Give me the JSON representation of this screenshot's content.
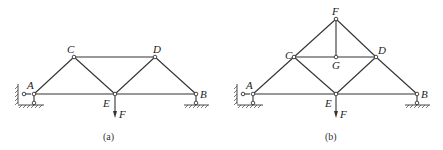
{
  "figures": [
    {
      "id": "a",
      "caption": "(a)",
      "nodes": {
        "A": {
          "label": "A",
          "x": 34,
          "y": 94
        },
        "C": {
          "label": "C",
          "x": 74,
          "y": 57
        },
        "D": {
          "label": "D",
          "x": 155,
          "y": 57
        },
        "E": {
          "label": "E",
          "x": 115,
          "y": 94
        },
        "B": {
          "label": "B",
          "x": 196,
          "y": 94
        }
      },
      "members": [
        [
          "A",
          "C"
        ],
        [
          "C",
          "D"
        ],
        [
          "D",
          "B"
        ],
        [
          "A",
          "E"
        ],
        [
          "E",
          "B"
        ],
        [
          "C",
          "E"
        ],
        [
          "E",
          "D"
        ]
      ],
      "load": {
        "label": "F",
        "at": "E",
        "direction": "down"
      },
      "supports": {
        "A": "fixed-pin-with-wall",
        "B": "roller"
      }
    },
    {
      "id": "b",
      "caption": "(b)",
      "nodes": {
        "A": {
          "label": "A",
          "x": 253,
          "y": 94
        },
        "C": {
          "label": "C",
          "x": 294,
          "y": 57
        },
        "F": {
          "label": "F",
          "x": 336,
          "y": 19
        },
        "G": {
          "label": "G",
          "x": 336,
          "y": 57
        },
        "D": {
          "label": "D",
          "x": 376,
          "y": 57
        },
        "E": {
          "label": "E",
          "x": 336,
          "y": 94
        },
        "B": {
          "label": "B",
          "x": 417,
          "y": 94
        }
      },
      "members": [
        [
          "A",
          "C"
        ],
        [
          "C",
          "F"
        ],
        [
          "F",
          "D"
        ],
        [
          "D",
          "B"
        ],
        [
          "A",
          "E"
        ],
        [
          "E",
          "B"
        ],
        [
          "C",
          "G"
        ],
        [
          "G",
          "D"
        ],
        [
          "F",
          "G"
        ],
        [
          "C",
          "E"
        ],
        [
          "E",
          "D"
        ]
      ],
      "load": {
        "label": "F",
        "at": "E",
        "direction": "down"
      },
      "supports": {
        "A": "fixed-pin-with-wall",
        "B": "roller"
      }
    }
  ],
  "labels": {
    "a": {
      "A": "A",
      "C": "C",
      "D": "D",
      "E": "E",
      "B": "B",
      "F": "F",
      "caption": "(a)"
    },
    "b": {
      "A": "A",
      "C": "C",
      "D": "D",
      "E": "E",
      "B": "B",
      "F_node": "F",
      "G": "G",
      "F_load": "F",
      "caption": "(b)"
    }
  }
}
